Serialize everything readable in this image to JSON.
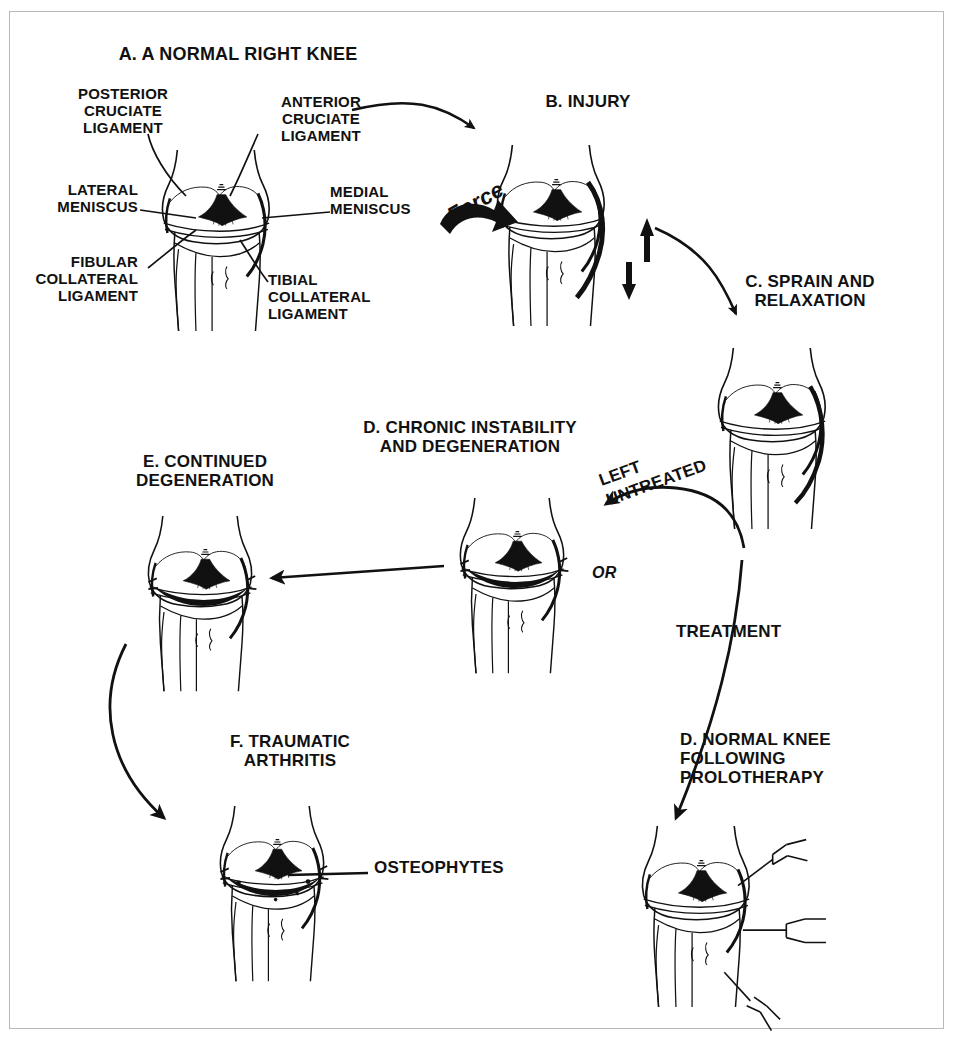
{
  "figure": {
    "type": "medical-diagram",
    "border_color": "#b8b8b8",
    "ink_color": "#111111",
    "background": "#ffffff"
  },
  "panels": {
    "a": {
      "title": "A. A NORMAL RIGHT KNEE",
      "labels": {
        "posterior_cruciate": "POSTERIOR\nCRUCIATE\nLIGAMENT",
        "anterior_cruciate": "ANTERIOR\nCRUCIATE\nLIGAMENT",
        "lateral_meniscus": "LATERAL\nMENISCUS",
        "medial_meniscus": "MEDIAL\nMENISCUS",
        "fibular_collateral": "FIBULAR\nCOLLATERAL\nLIGAMENT",
        "tibial_collateral": "TIBIAL\nCOLLATERAL\nLIGAMENT"
      }
    },
    "b": {
      "title": "B. INJURY",
      "force_label": "Force"
    },
    "c": {
      "title": "C. SPRAIN AND\nRELAXATION"
    },
    "d_chronic": {
      "title": "D. CHRONIC INSTABILITY\nAND DEGENERATION"
    },
    "e": {
      "title": "E. CONTINUED\nDEGENERATION"
    },
    "f": {
      "title": "F. TRAUMATIC\nARTHRITIS",
      "labels": {
        "osteophytes": "OSTEOPHYTES"
      }
    },
    "d_prolo": {
      "title": "D. NORMAL KNEE\nFOLLOWING\nPROLOTHERAPY"
    }
  },
  "flow_labels": {
    "left_untreated": "LEFT\nUNTREATED",
    "or": "OR",
    "treatment": "TREATMENT"
  }
}
